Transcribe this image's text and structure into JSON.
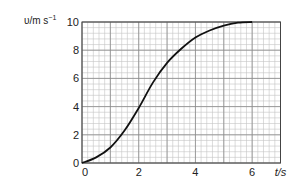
{
  "chart_data": {
    "type": "line",
    "title": "",
    "xlabel": "t/s",
    "ylabel": "v/m s^-1",
    "ylabel_parts": {
      "main": "υ/m s",
      "sup": "−1"
    },
    "xlim": [
      0,
      7
    ],
    "ylim": [
      0,
      10
    ],
    "x_ticks": [
      "0",
      "2",
      "4",
      "6"
    ],
    "y_ticks": [
      "0",
      "2",
      "4",
      "6",
      "8",
      "10"
    ],
    "grid": true,
    "legend": null,
    "series": [
      {
        "name": "velocity",
        "x": [
          0,
          0.5,
          1,
          1.5,
          2,
          2.5,
          3,
          3.5,
          4,
          4.5,
          5,
          5.5,
          6
        ],
        "values": [
          0,
          0.4,
          1.1,
          2.3,
          3.9,
          5.7,
          7.1,
          8.1,
          8.9,
          9.4,
          9.75,
          9.95,
          10
        ]
      }
    ],
    "colors": {
      "curve": "#111111",
      "grid_major": "#8a8a8a",
      "grid_minor": "#c4c4c4",
      "axis": "#444444"
    }
  }
}
